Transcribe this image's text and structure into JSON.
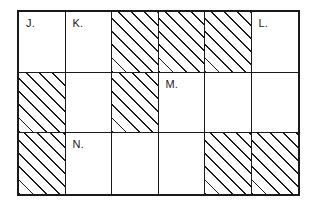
{
  "diagram": {
    "columns": 6,
    "rows": 3,
    "colors": {
      "line": "#1a1a1a",
      "background": "#ffffff",
      "hatch": "#1a1a1a"
    },
    "hatch": {
      "style": "diagonal-lines",
      "angle_degrees": 45,
      "direction": "bottom-left-to-top-right"
    },
    "cells": [
      {
        "row": 1,
        "col": 1,
        "label": "J.",
        "shaded": false
      },
      {
        "row": 1,
        "col": 2,
        "label": "K.",
        "shaded": false
      },
      {
        "row": 1,
        "col": 3,
        "label": "",
        "shaded": true
      },
      {
        "row": 1,
        "col": 4,
        "label": "",
        "shaded": true
      },
      {
        "row": 1,
        "col": 5,
        "label": "",
        "shaded": true
      },
      {
        "row": 1,
        "col": 6,
        "label": "L.",
        "shaded": false
      },
      {
        "row": 2,
        "col": 1,
        "label": "",
        "shaded": true
      },
      {
        "row": 2,
        "col": 2,
        "label": "",
        "shaded": false
      },
      {
        "row": 2,
        "col": 3,
        "label": "",
        "shaded": true
      },
      {
        "row": 2,
        "col": 4,
        "label": "M.",
        "shaded": false
      },
      {
        "row": 2,
        "col": 5,
        "label": "",
        "shaded": false
      },
      {
        "row": 2,
        "col": 6,
        "label": "",
        "shaded": false
      },
      {
        "row": 3,
        "col": 1,
        "label": "",
        "shaded": true
      },
      {
        "row": 3,
        "col": 2,
        "label": "N.",
        "shaded": false
      },
      {
        "row": 3,
        "col": 3,
        "label": "",
        "shaded": false
      },
      {
        "row": 3,
        "col": 4,
        "label": "",
        "shaded": false
      },
      {
        "row": 3,
        "col": 5,
        "label": "",
        "shaded": true
      },
      {
        "row": 3,
        "col": 6,
        "label": "",
        "shaded": true
      }
    ]
  }
}
